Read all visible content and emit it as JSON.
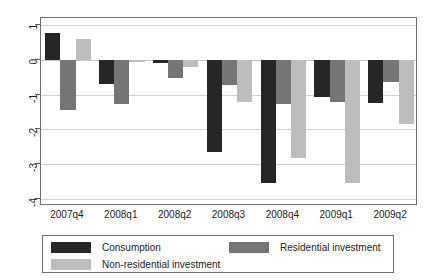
{
  "chart_data": {
    "type": "bar",
    "title": "",
    "subtitle": "",
    "xlabel": "",
    "ylabel": "",
    "categories": [
      "2007q4",
      "2008q1",
      "2008q2",
      "2008q3",
      "2008q4",
      "2009q1",
      "2009q2"
    ],
    "series": [
      {
        "name": "Consumption",
        "color": "#262626",
        "values": [
          0.78,
          -0.7,
          -0.1,
          -2.65,
          -3.53,
          -1.07,
          -1.23
        ]
      },
      {
        "name": "Residential investment",
        "color": "#757575",
        "values": [
          -1.44,
          -1.28,
          -0.52,
          -0.73,
          -1.26,
          -1.2,
          -0.63
        ]
      },
      {
        "name": "Non-residential investment",
        "color": "#bdbdbd",
        "values": [
          0.6,
          -0.07,
          -0.2,
          -1.2,
          -2.83,
          -3.53,
          -1.85
        ]
      }
    ],
    "ylim": [
      -4.2,
      1.2
    ],
    "yticks": [
      1,
      0,
      -1,
      -2,
      -3,
      -4
    ],
    "ytick_labels": [
      "1",
      "0",
      "-1",
      "-2",
      "-3",
      "-4"
    ],
    "grid": true,
    "legend_position": "bottom",
    "bar_orientation": "vertical",
    "grouping": "clustered"
  },
  "axes": {
    "y": {
      "ticks": [
        {
          "label": "1",
          "value": 1
        },
        {
          "label": "0",
          "value": 0
        },
        {
          "label": "-1",
          "value": -1
        },
        {
          "label": "-2",
          "value": -2
        },
        {
          "label": "-3",
          "value": -3
        },
        {
          "label": "-4",
          "value": -4
        }
      ]
    },
    "x": {
      "ticks": [
        {
          "label": "2007q4"
        },
        {
          "label": "2008q1"
        },
        {
          "label": "2008q2"
        },
        {
          "label": "2008q3"
        },
        {
          "label": "2008q4"
        },
        {
          "label": "2009q1"
        },
        {
          "label": "2009q2"
        }
      ]
    }
  },
  "legend": {
    "entries": [
      {
        "label": "Consumption",
        "color": "#262626"
      },
      {
        "label": "Residential investment",
        "color": "#757575"
      },
      {
        "label": "Non-residential investment",
        "color": "#bdbdbd"
      }
    ]
  }
}
